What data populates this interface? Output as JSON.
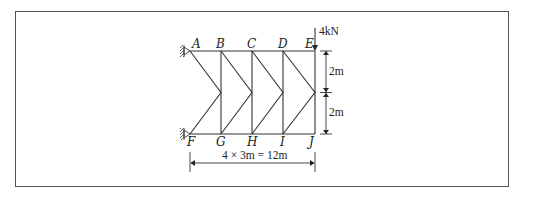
{
  "diagram": {
    "type": "truss",
    "nodes": {
      "top": [
        "A",
        "B",
        "C",
        "D",
        "E"
      ],
      "bottom": [
        "F",
        "G",
        "H",
        "I",
        "J"
      ]
    },
    "load": {
      "label": "4kN",
      "at": "E",
      "direction": "down"
    },
    "supports": [
      {
        "node": "A",
        "type": "pin-wall"
      },
      {
        "node": "F",
        "type": "pin-wall"
      }
    ],
    "dimensions": {
      "upper_height": "2m",
      "lower_height": "2m",
      "span": "4 × 3m = 12m"
    }
  }
}
